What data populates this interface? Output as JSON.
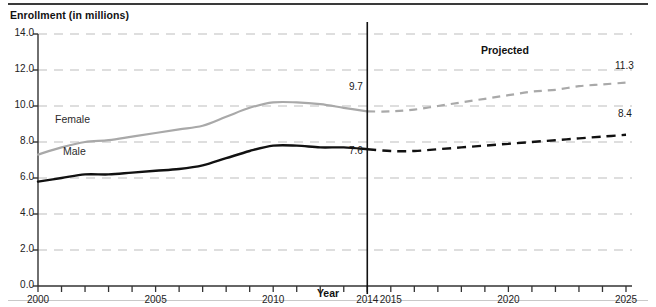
{
  "chart_data": {
    "type": "line",
    "title": "Enrollment (in millions)",
    "xlabel": "Year",
    "ylabel": "Enrollment (in millions)",
    "xlim": [
      2000,
      2025
    ],
    "ylim": [
      0.0,
      14.0
    ],
    "grid": true,
    "legend_position": "inline",
    "y_ticks": [
      "14.0",
      "12.0",
      "10.0",
      "8.0",
      "6.0",
      "4.0",
      "2.0",
      "0.0"
    ],
    "y_tick_values": [
      14.0,
      12.0,
      10.0,
      8.0,
      6.0,
      4.0,
      2.0,
      0.0
    ],
    "x_ticks": [
      "2000",
      "2005",
      "2010",
      "2014",
      "2015",
      "2020",
      "2025"
    ],
    "x_tick_values": [
      2000,
      2005,
      2010,
      2014,
      2015,
      2020,
      2025
    ],
    "divider_year": 2014,
    "projected_label": "Projected",
    "x": [
      2000,
      2001,
      2002,
      2003,
      2004,
      2005,
      2006,
      2007,
      2008,
      2009,
      2010,
      2011,
      2012,
      2013,
      2014,
      2015,
      2016,
      2017,
      2018,
      2019,
      2020,
      2021,
      2022,
      2023,
      2024,
      2025
    ],
    "series": [
      {
        "name": "Female",
        "color": "#a9a9a9",
        "actual_end_year": 2014,
        "end_value_label": "9.7",
        "projected_end_label": "11.3",
        "values": [
          7.3,
          7.7,
          8.0,
          8.1,
          8.3,
          8.5,
          8.7,
          8.9,
          9.4,
          9.9,
          10.2,
          10.2,
          10.1,
          9.9,
          9.7,
          9.7,
          9.8,
          10.0,
          10.2,
          10.4,
          10.6,
          10.8,
          10.9,
          11.1,
          11.2,
          11.3
        ]
      },
      {
        "name": "Male",
        "color": "#111111",
        "actual_end_year": 2014,
        "end_value_label": "7.6",
        "projected_end_label": "8.4",
        "values": [
          5.8,
          6.0,
          6.2,
          6.2,
          6.3,
          6.4,
          6.5,
          6.7,
          7.1,
          7.5,
          7.8,
          7.8,
          7.7,
          7.7,
          7.6,
          7.5,
          7.5,
          7.6,
          7.7,
          7.8,
          7.9,
          8.0,
          8.1,
          8.2,
          8.3,
          8.4
        ]
      }
    ]
  }
}
